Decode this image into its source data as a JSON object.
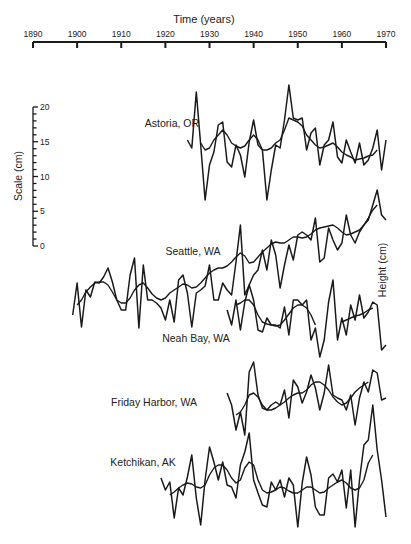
{
  "chart_data": {
    "type": "line",
    "title": "",
    "xlabel": "Time (years)",
    "ylabel_left": "Scale (cm)",
    "ylabel_right": "Height (cm)",
    "x_ticks": [
      1890,
      1900,
      1910,
      1920,
      1930,
      1940,
      1950,
      1960,
      1970
    ],
    "xlim": [
      1890,
      1970
    ],
    "scale_ticks": [
      0,
      5,
      10,
      15,
      20
    ],
    "scale_range_cm": [
      0,
      20
    ],
    "grid": false,
    "legend": "none (series labelled inline)",
    "series": [
      {
        "name": "Astoria, OR",
        "x": [
          1925,
          1926,
          1927,
          1928,
          1929,
          1930,
          1931,
          1932,
          1933,
          1934,
          1935,
          1936,
          1937,
          1938,
          1939,
          1940,
          1941,
          1942,
          1943,
          1944,
          1945,
          1946,
          1947,
          1948,
          1949,
          1950,
          1951,
          1952,
          1953,
          1954,
          1955,
          1956,
          1957,
          1958,
          1959,
          1960,
          1961,
          1962,
          1963,
          1964,
          1965,
          1966,
          1967,
          1968,
          1969,
          1970
        ],
        "raw_px_y": [
          140,
          148,
          92,
          145,
          200,
          165,
          152,
          125,
          122,
          162,
          167,
          145,
          155,
          177,
          142,
          120,
          145,
          150,
          200,
          170,
          145,
          148,
          120,
          85,
          118,
          120,
          118,
          150,
          133,
          128,
          165,
          145,
          140,
          122,
          157,
          163,
          140,
          152,
          163,
          143,
          165,
          160,
          148,
          130,
          170,
          140
        ],
        "smooth_px_y": [
          null,
          null,
          null,
          143,
          150,
          148,
          140,
          135,
          130,
          135,
          143,
          146,
          148,
          146,
          140,
          135,
          140,
          150,
          150,
          148,
          143,
          140,
          130,
          118,
          120,
          122,
          126,
          135,
          140,
          145,
          148,
          147,
          145,
          143,
          147,
          152,
          155,
          157,
          160,
          159,
          158,
          156,
          155,
          150,
          null,
          null
        ]
      },
      {
        "name": "Seattle, WA",
        "x": [
          1899,
          1900,
          1901,
          1902,
          1903,
          1904,
          1905,
          1906,
          1907,
          1908,
          1909,
          1910,
          1911,
          1912,
          1913,
          1914,
          1915,
          1916,
          1917,
          1918,
          1919,
          1920,
          1921,
          1922,
          1923,
          1924,
          1925,
          1926,
          1927,
          1928,
          1929,
          1930,
          1931,
          1932,
          1933,
          1934,
          1935,
          1936,
          1937,
          1938,
          1939,
          1940,
          1941,
          1942,
          1943,
          1944,
          1945,
          1946,
          1947,
          1948,
          1949,
          1950,
          1951,
          1952,
          1953,
          1954,
          1955,
          1956,
          1957,
          1958,
          1959,
          1960,
          1961,
          1962,
          1963,
          1964,
          1965,
          1966,
          1967,
          1968,
          1969,
          1970
        ],
        "raw_px_y": [
          315,
          283,
          327,
          290,
          297,
          282,
          283,
          277,
          268,
          282,
          300,
          310,
          310,
          275,
          258,
          328,
          265,
          300,
          300,
          303,
          308,
          320,
          300,
          322,
          280,
          275,
          293,
          327,
          293,
          290,
          286,
          265,
          300,
          300,
          283,
          290,
          295,
          262,
          225,
          295,
          285,
          275,
          270,
          250,
          270,
          240,
          255,
          288,
          265,
          245,
          260,
          235,
          232,
          235,
          240,
          218,
          262,
          258,
          228,
          240,
          250,
          243,
          215,
          235,
          243,
          232,
          225,
          220,
          205,
          190,
          215,
          220
        ],
        "smooth_px_y": [
          null,
          305,
          300,
          292,
          287,
          283,
          282,
          282,
          285,
          292,
          300,
          303,
          303,
          298,
          290,
          285,
          283,
          288,
          294,
          298,
          300,
          298,
          293,
          290,
          287,
          284,
          285,
          288,
          287,
          283,
          278,
          273,
          270,
          268,
          268,
          266,
          262,
          257,
          253,
          256,
          263,
          262,
          257,
          252,
          248,
          244,
          242,
          243,
          243,
          240,
          237,
          237,
          238,
          237,
          234,
          230,
          228,
          227,
          226,
          225,
          228,
          232,
          235,
          234,
          232,
          230,
          225,
          218,
          210,
          205,
          null,
          null
        ]
      },
      {
        "name": "Neah Bay, WA",
        "x": [
          1934,
          1935,
          1936,
          1937,
          1938,
          1939,
          1940,
          1941,
          1942,
          1943,
          1944,
          1945,
          1946,
          1947,
          1948,
          1949,
          1950,
          1951,
          1952,
          1953,
          1954,
          1955,
          1956,
          1957,
          1958,
          1959,
          1960,
          1961,
          1962,
          1963,
          1964,
          1965,
          1966,
          1967,
          1968,
          1969,
          1970
        ],
        "raw_px_y": [
          310,
          325,
          300,
          330,
          302,
          285,
          300,
          330,
          332,
          318,
          325,
          325,
          328,
          307,
          335,
          300,
          300,
          305,
          300,
          340,
          328,
          357,
          340,
          302,
          280,
          340,
          318,
          335,
          305,
          320,
          295,
          318,
          312,
          302,
          305,
          350,
          345
        ],
        "smooth_px_y": [
          null,
          null,
          305,
          303,
          300,
          300,
          305,
          315,
          322,
          324,
          325,
          326,
          325,
          320,
          314,
          308,
          305,
          305,
          308,
          315,
          325,
          null,
          null,
          null,
          null,
          null,
          322,
          320,
          318,
          316,
          315,
          313,
          310,
          308,
          null,
          null,
          null
        ]
      },
      {
        "name": "Friday Harbor, WA",
        "x": [
          1934,
          1935,
          1936,
          1937,
          1938,
          1939,
          1940,
          1941,
          1942,
          1943,
          1944,
          1945,
          1946,
          1947,
          1948,
          1949,
          1950,
          1951,
          1952,
          1953,
          1954,
          1955,
          1956,
          1957,
          1958,
          1959,
          1960,
          1961,
          1962,
          1963,
          1964,
          1965,
          1966,
          1967,
          1968,
          1969,
          1970
        ],
        "raw_px_y": [
          393,
          405,
          430,
          412,
          435,
          372,
          362,
          395,
          408,
          410,
          405,
          402,
          405,
          390,
          418,
          380,
          387,
          403,
          392,
          375,
          388,
          410,
          393,
          365,
          395,
          398,
          400,
          410,
          395,
          425,
          398,
          382,
          392,
          370,
          373,
          400,
          398
        ],
        "smooth_px_y": [
          null,
          null,
          415,
          412,
          405,
          395,
          393,
          397,
          405,
          410,
          410,
          408,
          405,
          402,
          398,
          395,
          393,
          393,
          390,
          385,
          382,
          382,
          385,
          390,
          397,
          402,
          405,
          403,
          398,
          392,
          388,
          385,
          382,
          null,
          null,
          null,
          null
        ]
      },
      {
        "name": "Ketchikan, AK",
        "x": [
          1919,
          1920,
          1921,
          1922,
          1923,
          1924,
          1925,
          1926,
          1927,
          1928,
          1929,
          1930,
          1931,
          1932,
          1933,
          1934,
          1935,
          1936,
          1937,
          1938,
          1939,
          1940,
          1941,
          1942,
          1943,
          1944,
          1945,
          1946,
          1947,
          1948,
          1949,
          1950,
          1951,
          1952,
          1953,
          1954,
          1955,
          1956,
          1957,
          1958,
          1959,
          1960,
          1961,
          1962,
          1963,
          1964,
          1965,
          1966,
          1967,
          1968,
          1969,
          1970
        ],
        "raw_px_y": [
          478,
          490,
          482,
          518,
          488,
          495,
          477,
          455,
          498,
          525,
          480,
          447,
          462,
          480,
          462,
          485,
          487,
          498,
          465,
          452,
          433,
          480,
          493,
          505,
          507,
          482,
          490,
          480,
          497,
          478,
          485,
          527,
          483,
          457,
          475,
          507,
          515,
          515,
          478,
          474,
          482,
          470,
          508,
          470,
          527,
          480,
          445,
          440,
          405,
          450,
          480,
          517
        ],
        "smooth_px_y": [
          null,
          null,
          495,
          492,
          488,
          485,
          483,
          484,
          487,
          488,
          485,
          475,
          468,
          465,
          465,
          470,
          478,
          483,
          480,
          468,
          462,
          465,
          480,
          490,
          493,
          492,
          490,
          487,
          488,
          491,
          493,
          493,
          490,
          487,
          487,
          490,
          493,
          492,
          488,
          485,
          482,
          480,
          483,
          488,
          490,
          488,
          480,
          463,
          455,
          null,
          null,
          null
        ]
      }
    ]
  },
  "axis": {
    "x_title": "Time (years)",
    "x_ticks": [
      "1890",
      "1900",
      "1910",
      "1920",
      "1930",
      "1940",
      "1950",
      "1960",
      "1970"
    ],
    "scale_title": "Scale (cm)",
    "scale_ticks": [
      "20",
      "15",
      "10",
      "5",
      "0"
    ],
    "right_title": "Height (cm)"
  },
  "labels": {
    "astoria": "Astoria, OR",
    "seattle": "Seattle, WA",
    "neah_bay": "Neah Bay, WA",
    "friday_harbor": "Friday Harbor, WA",
    "ketchikan": "Ketchikan, AK"
  }
}
